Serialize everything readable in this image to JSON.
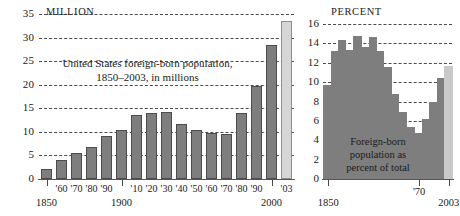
{
  "chart_data": [
    {
      "type": "bar",
      "id": "foreign-born-millions",
      "title": "United States foreign-born population,",
      "subtitle": "1850–2003, in millions",
      "unit_label": "MILLION",
      "xlabel": "",
      "ylabel": "",
      "ylim": [
        0,
        35
      ],
      "yticks": [
        0,
        5,
        10,
        15,
        20,
        25,
        30,
        35
      ],
      "grid": true,
      "grid_style": "dashed horizontal",
      "categories": [
        "1850",
        "'60",
        "'70",
        "'80",
        "'90",
        "1900",
        "'10",
        "'20",
        "'30",
        "'40",
        "'50",
        "'60",
        "'70",
        "'80",
        "'90",
        "2000",
        "'03"
      ],
      "values": [
        2.2,
        4.1,
        5.6,
        6.7,
        9.2,
        10.3,
        13.5,
        13.9,
        14.2,
        11.6,
        10.3,
        9.7,
        9.6,
        14.1,
        19.8,
        28.4,
        33.5
      ],
      "highlight_index": 16,
      "highlight_note": "final bar shown in light gray",
      "major_xlabels": [
        "1850",
        "1900",
        "2000"
      ]
    },
    {
      "type": "area",
      "id": "foreign-born-percent",
      "title": "Foreign-born population as percent of total",
      "title_lines": [
        "Foreign-born",
        "population as",
        "percent of total"
      ],
      "unit_label": "PERCENT",
      "xlabel": "",
      "ylabel": "",
      "ylim": [
        0,
        16
      ],
      "yticks": [
        0,
        2,
        4,
        6,
        8,
        10,
        12,
        14,
        16
      ],
      "grid": true,
      "grid_style": "dashed horizontal",
      "x": [
        "1850",
        "1860",
        "1870",
        "1880",
        "1890",
        "1900",
        "1910",
        "1920",
        "1930",
        "1940",
        "1950",
        "1960",
        "1970",
        "1980",
        "1990",
        "2000",
        "2003"
      ],
      "values": [
        9.7,
        13.2,
        14.4,
        13.3,
        14.8,
        13.6,
        14.7,
        13.2,
        11.6,
        8.8,
        6.9,
        5.4,
        4.7,
        6.2,
        7.9,
        10.4,
        11.7
      ],
      "highlight_index": 16,
      "highlight_note": "final step shown in light gray",
      "xtick_labels": [
        "1850",
        "'70",
        "2003"
      ]
    }
  ],
  "left": {
    "unit": "MILLION",
    "caption_line1": "United States foreign-born population,",
    "caption_line2": "1850–2003, in millions",
    "yticks": [
      "35",
      "30",
      "25",
      "20",
      "15",
      "10",
      "5",
      "0"
    ],
    "xlabels": [
      "1850",
      "'60",
      "'70",
      "'80",
      "'90",
      "1900",
      "'10",
      "'20",
      "'30",
      "'40",
      "'50",
      "'60",
      "'70",
      "'80",
      "'90",
      "2000",
      "'03"
    ]
  },
  "right": {
    "unit": "PERCENT",
    "caption_line1": "Foreign-born",
    "caption_line2": "population as",
    "caption_line3": "percent of total",
    "yticks": [
      "16",
      "14",
      "12",
      "10",
      "8",
      "6",
      "4",
      "2",
      "0"
    ],
    "xlabels": [
      "1850",
      "'70",
      "2003"
    ]
  },
  "colors": {
    "bar": "#7e7e7e",
    "bar_outline": "#4c4c4c",
    "bar_projected": "#d6d6d6",
    "grid": "#2b2b2b",
    "text": "#1a1a1a",
    "background": "#ffffff"
  }
}
